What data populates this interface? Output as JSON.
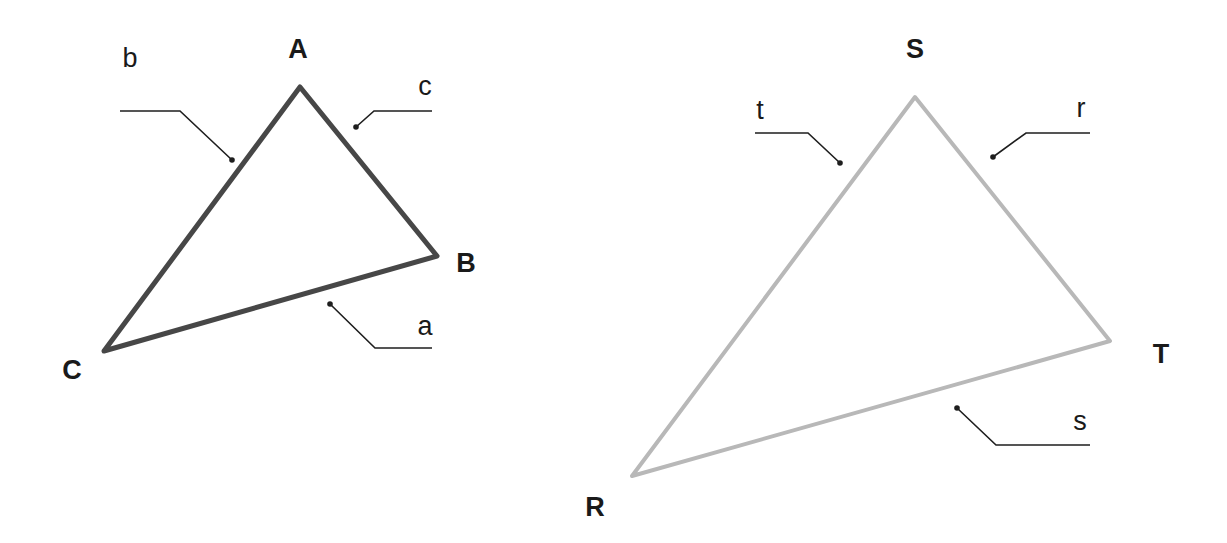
{
  "triangles": [
    {
      "id": "ABC",
      "stroke_color": "#474747",
      "stroke_width": 5,
      "vertices": {
        "A": {
          "label": "A",
          "x": 300,
          "y": 87,
          "label_x": 298,
          "label_y": 58
        },
        "B": {
          "label": "B",
          "x": 437,
          "y": 256,
          "label_x": 466,
          "label_y": 272
        },
        "C": {
          "label": "C",
          "x": 104,
          "y": 351,
          "label_x": 72,
          "label_y": 379
        }
      },
      "sides": {
        "b": {
          "label": "b",
          "label_x": 130,
          "label_y": 67,
          "leader": "120,111 180,111 232,160",
          "dot_x": 232,
          "dot_y": 160
        },
        "c": {
          "label": "c",
          "label_x": 425,
          "label_y": 95,
          "leader": "432,111 374,111 356,127",
          "dot_x": 356,
          "dot_y": 127
        },
        "a": {
          "label": "a",
          "label_x": 425,
          "label_y": 335,
          "leader": "432,348 375,348 330,304",
          "dot_x": 330,
          "dot_y": 304
        }
      }
    },
    {
      "id": "RST",
      "stroke_color": "#b8b8b8",
      "stroke_width": 4,
      "vertices": {
        "S": {
          "label": "S",
          "x": 915,
          "y": 97,
          "label_x": 915,
          "label_y": 58
        },
        "T": {
          "label": "T",
          "x": 1110,
          "y": 341,
          "label_x": 1161,
          "label_y": 363
        },
        "R": {
          "label": "R",
          "x": 632,
          "y": 476,
          "label_x": 595,
          "label_y": 516
        }
      },
      "sides": {
        "t": {
          "label": "t",
          "label_x": 760,
          "label_y": 119,
          "leader": "755,133 808,133 840,163",
          "dot_x": 840,
          "dot_y": 163
        },
        "r": {
          "label": "r",
          "label_x": 1081,
          "label_y": 117,
          "leader": "1090,133 1026,133 993,157",
          "dot_x": 993,
          "dot_y": 157
        },
        "s": {
          "label": "s",
          "label_x": 1080,
          "label_y": 430,
          "leader": "1090,445 996,445 957,408",
          "dot_x": 957,
          "dot_y": 408
        }
      }
    }
  ]
}
